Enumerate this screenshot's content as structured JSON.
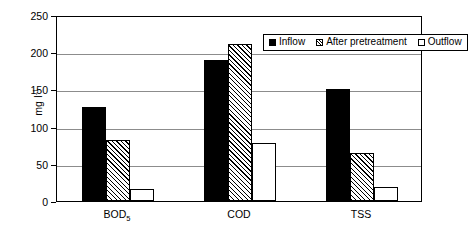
{
  "chart_data": {
    "type": "bar",
    "title": "",
    "subtitle": "",
    "xlabel": "",
    "ylabel": "mg l⁻¹",
    "ylabel_base": "mg l",
    "ylabel_exponent": "-1",
    "categories": [
      "BOD₅",
      "COD",
      "TSS"
    ],
    "category_labels": [
      {
        "base": "BOD",
        "sub": "5"
      },
      {
        "base": "COD",
        "sub": ""
      },
      {
        "base": "TSS",
        "sub": ""
      }
    ],
    "series": [
      {
        "name": "Inflow",
        "values": [
          127,
          190,
          150
        ],
        "style": "solid-black",
        "color": "#000000"
      },
      {
        "name": "After pretreatment",
        "values": [
          82,
          211,
          65
        ],
        "style": "diagonal-hatch",
        "color": "#cccccc"
      },
      {
        "name": "Outflow",
        "values": [
          16,
          78,
          19
        ],
        "style": "white-open",
        "color": "#ffffff"
      }
    ],
    "ylim": [
      0,
      250
    ],
    "yticks": [
      0,
      50,
      100,
      150,
      200,
      250
    ],
    "ytick_labels": [
      "0",
      "50",
      "100",
      "150",
      "200",
      "250"
    ],
    "grid": true,
    "grid_axis": "y",
    "grid_color": "#8c8c8c",
    "legend_position": "top-right-inside",
    "frame_color": "#000000",
    "background_color": "#ffffff"
  },
  "legend": {
    "entries": [
      {
        "label": "Inflow"
      },
      {
        "label": "After pretreatment"
      },
      {
        "label": "Outflow"
      }
    ]
  }
}
